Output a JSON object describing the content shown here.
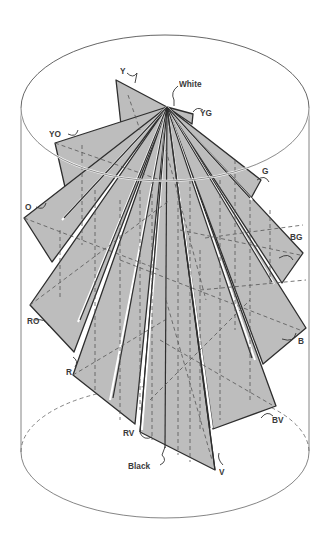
{
  "figure": {
    "fill_color": "#bdbdbd",
    "line_color": "#333333",
    "background": "#ffffff"
  },
  "labels": {
    "white": "White",
    "black": "Black",
    "y": "Y",
    "yg": "YG",
    "g": "G",
    "bg": "BG",
    "b": "B",
    "bv": "BV",
    "v": "V",
    "rv": "RV",
    "r": "R",
    "ro": "RO",
    "o": "O",
    "yo": "YO"
  }
}
